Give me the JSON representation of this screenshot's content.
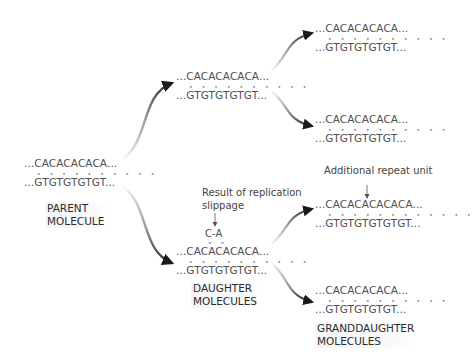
{
  "diagram": {
    "parent": {
      "top_strand": "...CACACACACA...",
      "bottom_strand": "...GTGTGTGTGT...",
      "label_line1": "PARENT",
      "label_line2": "MOLECULE"
    },
    "daughters": [
      {
        "top_strand": "...CACACACACA...",
        "bottom_strand": "...GTGTGTGTGT..."
      },
      {
        "loop": "C-A",
        "annotation_line1": "Result of replication",
        "annotation_line2": "slippage",
        "top_strand": "...CACACACACA...",
        "bottom_strand": "...GTGTGTGTGT..."
      }
    ],
    "daughter_label_line1": "DAUGHTER",
    "daughter_label_line2": "MOLECULES",
    "granddaughters": [
      {
        "top_strand": "...CACACACACA...",
        "bottom_strand": "...GTGTGTGTGT..."
      },
      {
        "top_strand": "...CACACACACA...",
        "bottom_strand": "...GTGTGTGTGT..."
      },
      {
        "annotation": "Additional repeat unit",
        "top_strand": "...CACACACACACA...",
        "bottom_strand": "...GTGTGTGTGTGT..."
      },
      {
        "top_strand": "...CACACACACA...",
        "bottom_strand": "...GTGTGTGTGT..."
      }
    ],
    "granddaughter_label_line1": "GRANDDAUGHTER",
    "granddaughter_label_line2": "MOLECULES",
    "base_pair_dots": "• • • • • • • • • •",
    "base_pair_dots_long": "• • • • • • • • • • • •",
    "loop_dots": "• •"
  }
}
